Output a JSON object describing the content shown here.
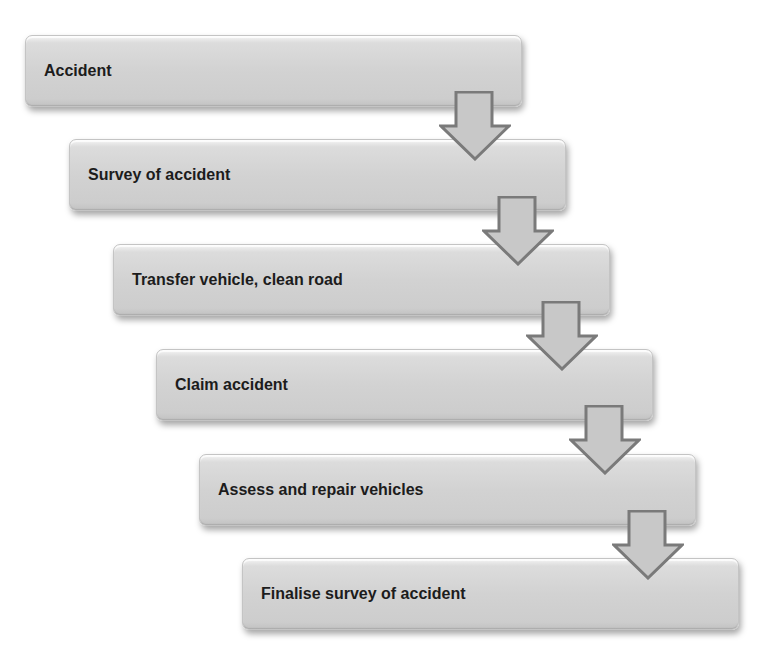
{
  "diagram": {
    "type": "staircase-process-flow",
    "colors": {
      "box_fill": "#d2d2d2",
      "arrow_fill": "#c8c8c8",
      "arrow_stroke": "#7a7a7a",
      "text": "#1c1c1c"
    },
    "steps": [
      {
        "label": "Accident"
      },
      {
        "label": "Survey of accident"
      },
      {
        "label": "Transfer vehicle, clean road"
      },
      {
        "label": "Claim accident"
      },
      {
        "label": "Assess and repair vehicles"
      },
      {
        "label": "Finalise survey of accident"
      }
    ],
    "connectors": [
      {
        "from": "Accident",
        "to": "Survey of accident",
        "icon": "down-arrow-icon"
      },
      {
        "from": "Survey of accident",
        "to": "Transfer vehicle, clean road",
        "icon": "down-arrow-icon"
      },
      {
        "from": "Transfer vehicle, clean road",
        "to": "Claim accident",
        "icon": "down-arrow-icon"
      },
      {
        "from": "Claim accident",
        "to": "Assess and repair vehicles",
        "icon": "down-arrow-icon"
      },
      {
        "from": "Assess and repair vehicles",
        "to": "Finalise survey of accident",
        "icon": "down-arrow-icon"
      }
    ]
  }
}
